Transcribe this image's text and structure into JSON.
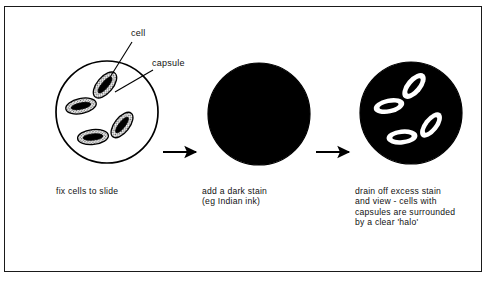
{
  "figure": {
    "border_color": "#1a1a1a",
    "background_color": "#ffffff",
    "ink_color": "#000000"
  },
  "annotations": [
    {
      "id": "cell",
      "label": "cell",
      "name": "annotation-label-cell"
    },
    {
      "id": "capsule",
      "label": "capsule",
      "name": "annotation-label-capsule"
    }
  ],
  "steps": [
    {
      "id": "step-1",
      "caption": "fix cells to slide",
      "panel": "unstained-slide-circle",
      "circle_fill": "#ffffff",
      "circle_stroke": "#000000",
      "cell_count": 4
    },
    {
      "id": "step-2",
      "caption": "add a dark stain\n(eg Indian ink)",
      "panel": "dark-stain-circle",
      "circle_fill": "#000000",
      "circle_stroke": "#000000",
      "cell_count": 0
    },
    {
      "id": "step-3",
      "caption": "drain off excess stain\nand view - cells with\ncapsules are surrounded\nby a clear 'halo'",
      "panel": "halo-circle",
      "circle_fill": "#000000",
      "circle_stroke": "#000000",
      "halo_fill": "#ffffff",
      "cell_count": 4
    }
  ],
  "arrows": [
    {
      "id": "arrow-1",
      "from": "step-1",
      "to": "step-2",
      "direction": "right"
    },
    {
      "id": "arrow-2",
      "from": "step-2",
      "to": "step-3",
      "direction": "right"
    }
  ],
  "cells": {
    "slide": [
      {
        "cx": 105,
        "cy": 85,
        "rx": 15.5,
        "ry": 8.0,
        "rot": -50
      },
      {
        "cx": 81,
        "cy": 106,
        "rx": 15.5,
        "ry": 7.5,
        "rot": -12
      },
      {
        "cx": 122,
        "cy": 125,
        "rx": 15.0,
        "ry": 7.5,
        "rot": -52
      },
      {
        "cx": 93,
        "cy": 137,
        "rx": 15.5,
        "ry": 7.5,
        "rot": -6
      }
    ],
    "halo": [
      {
        "cx": 414,
        "cy": 86,
        "rx": 15.5,
        "ry": 8.0,
        "rot": -50
      },
      {
        "cx": 389,
        "cy": 106,
        "rx": 15.5,
        "ry": 7.5,
        "rot": -12
      },
      {
        "cx": 431,
        "cy": 125,
        "rx": 15.0,
        "ry": 7.5,
        "rot": -52
      },
      {
        "cx": 402,
        "cy": 137,
        "rx": 15.5,
        "ry": 7.5,
        "rot": -6
      }
    ]
  }
}
